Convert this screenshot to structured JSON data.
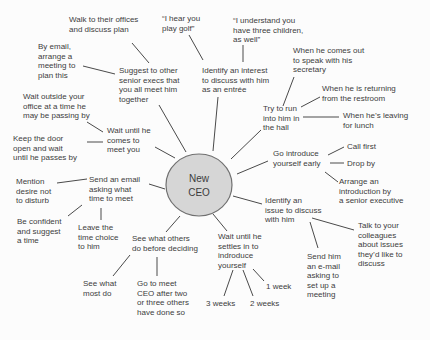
{
  "diagram": {
    "title_implicit": "Ways to meet the New CEO mind map",
    "center": {
      "label": "New\nCEO"
    },
    "colors": {
      "background": "#fcfcfc",
      "text": "#3c3c3c",
      "line": "#4a4a4a",
      "node_fill": "#d6d6d6",
      "node_stroke": "#707070"
    }
  },
  "nodes": [
    {
      "id": "walk-offices",
      "text": "Walk to their offices\nand discuss plan"
    },
    {
      "id": "hear-golf",
      "text": "“I hear you\nplay golf”"
    },
    {
      "id": "understand-children",
      "text": "“I understand you\nhave three children,\nas well”"
    },
    {
      "id": "by-email-arrange",
      "text": "By email,\narrange a\nmeeting to\nplan this"
    },
    {
      "id": "suggest-execs",
      "text": "Suggest to other\nsenior execs that\nyou all meet him\ntogether"
    },
    {
      "id": "identify-interest",
      "text": "Identify an interest\nto discuss with him\nas an entrée"
    },
    {
      "id": "when-secretary",
      "text": "When he comes out\nto speak with his\nsecretary"
    },
    {
      "id": "when-restroom",
      "text": "When he is returning\nfrom the restroom"
    },
    {
      "id": "wait-outside",
      "text": "Wait outside your\noffice at a time he\nmay be passing by"
    },
    {
      "id": "try-run-hall",
      "text": "Try to run\ninto him in\nthe hall"
    },
    {
      "id": "when-lunch",
      "text": "When he’s leaving\nfor lunch"
    },
    {
      "id": "keep-door",
      "text": "Keep the door\nopen and wait\nuntil he passes by"
    },
    {
      "id": "wait-comes",
      "text": "Wait until he\ncomes to\nmeet you"
    },
    {
      "id": "call-first",
      "text": "Call first"
    },
    {
      "id": "go-introduce",
      "text": "Go introduce\nyourself early"
    },
    {
      "id": "drop-by",
      "text": "Drop by"
    },
    {
      "id": "arrange-intro",
      "text": "Arrange an\nintroduction by\na senior executive"
    },
    {
      "id": "mention-desire",
      "text": "Mention\ndesire not\nto disturb"
    },
    {
      "id": "send-email-time",
      "text": "Send an email\nasking what\ntime to meet"
    },
    {
      "id": "identify-issue",
      "text": "Identify an\nissue to discuss\nwith him"
    },
    {
      "id": "be-confident",
      "text": "Be confident\nand suggest\na time"
    },
    {
      "id": "leave-time",
      "text": "Leave the\ntime choice\nto him"
    },
    {
      "id": "see-others",
      "text": "See what others\ndo before deciding"
    },
    {
      "id": "talk-colleagues",
      "text": "Talk to your\ncolleagues\nabout issues\nthey’d like to\ndiscuss"
    },
    {
      "id": "wait-settles",
      "text": "Wait until he\nsettles in to\nindroduce\nyourself"
    },
    {
      "id": "send-email-setup",
      "text": "Send him\nan e-mail\nasking to\nset up a\nmeeting"
    },
    {
      "id": "see-most",
      "text": "See what\nmost do"
    },
    {
      "id": "go-meet-after",
      "text": "Go to meet\nCEO after two\nor three others\nhave done so"
    },
    {
      "id": "one-week",
      "text": "1 week"
    },
    {
      "id": "two-weeks",
      "text": "2 weeks"
    },
    {
      "id": "three-weeks",
      "text": "3 weeks"
    }
  ]
}
